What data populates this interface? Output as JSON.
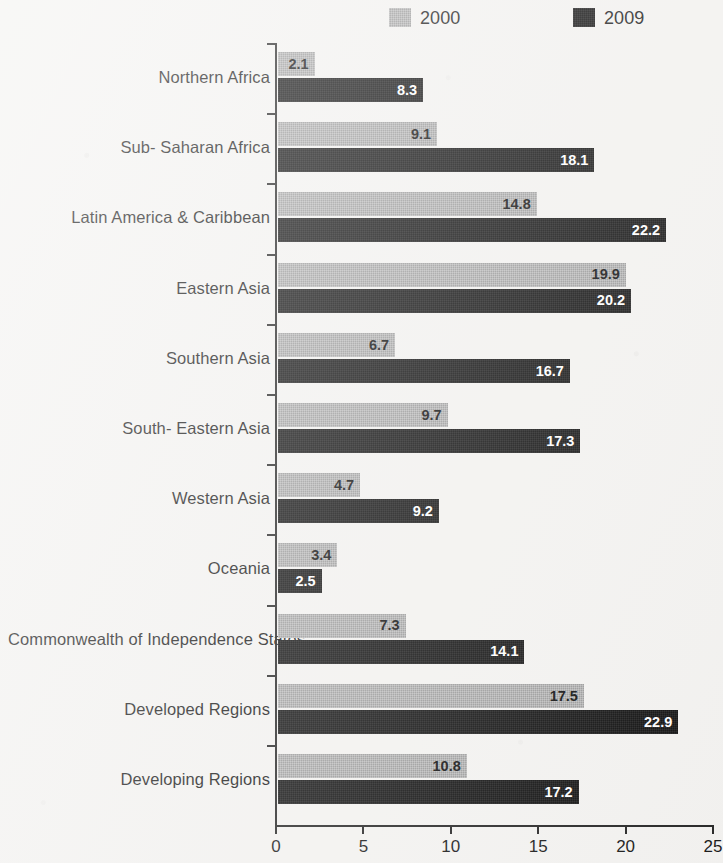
{
  "chart_data": {
    "type": "bar",
    "orientation": "horizontal",
    "title": "",
    "subtitle": "",
    "xlabel": "",
    "ylabel": "",
    "xlim": [
      0,
      25
    ],
    "xticks": [
      "0",
      "5",
      "10",
      "15",
      "20",
      "25"
    ],
    "grid": false,
    "legend_position": "top",
    "categories": [
      "Northern Africa",
      "Sub- Saharan Africa",
      "Latin America & Caribbean",
      "Eastern Asia",
      "Southern Asia",
      "South- Eastern Asia",
      "Western Asia",
      "Oceania",
      "Commonwealth of Independence States",
      "Developed Regions",
      "Developing Regions"
    ],
    "series": [
      {
        "name": "2000",
        "color": "#9b9b9b",
        "values": [
          2.1,
          9.1,
          14.8,
          19.9,
          6.7,
          9.7,
          4.7,
          3.4,
          7.3,
          17.5,
          10.8
        ],
        "labels": [
          "2.1",
          "9.1",
          "14.8",
          "19.9",
          "6.7",
          "9.7",
          "4.7",
          "3.4",
          "7.3",
          "17.5",
          "10.8"
        ]
      },
      {
        "name": "2009",
        "color": "#101010",
        "values": [
          8.3,
          18.1,
          22.2,
          20.2,
          16.7,
          17.3,
          9.2,
          2.5,
          14.1,
          22.9,
          17.2
        ],
        "labels": [
          "8.3",
          "18.1",
          "22.2",
          "20.2",
          "16.7",
          "17.3",
          "9.2",
          "2.5",
          "14.1",
          "22.9",
          "17.2"
        ]
      }
    ]
  },
  "legend": {
    "items": [
      {
        "label": "2000",
        "color": "#9b9b9b"
      },
      {
        "label": "2009",
        "color": "#101010"
      }
    ]
  }
}
